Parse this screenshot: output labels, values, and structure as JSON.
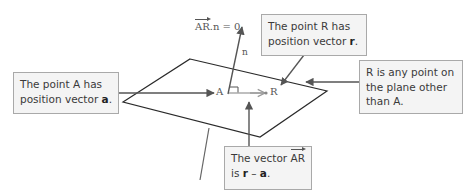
{
  "diagram": {
    "equation": {
      "vec": "AR",
      "rest": ".n = 0"
    },
    "labels": {
      "normal": "n",
      "point_a": "A",
      "point_r": "R"
    },
    "callouts": {
      "point_a": {
        "line1": "The point A has",
        "line2_pre": "position vector ",
        "line2_bold": "a",
        "line2_post": "."
      },
      "point_r": {
        "line1": "The point R has",
        "line2_pre": "position vector ",
        "line2_bold": "r",
        "line2_post": "."
      },
      "any_point": {
        "line1": "R is any point on",
        "line2": "the plane other",
        "line3": "than A."
      },
      "vector_ar": {
        "line1_pre": "The vector ",
        "line1_vec": "AR",
        "line2_pre": "is ",
        "line2_bold1": "r",
        "line2_mid": " – ",
        "line2_bold2": "a",
        "line2_post": "."
      }
    },
    "colors": {
      "plane_line": "#2a2a2a",
      "arrow": "#555555",
      "callout_bg": "#f4f4f4",
      "callout_border": "#a9a9a9",
      "text": "#3a3a3a"
    }
  }
}
